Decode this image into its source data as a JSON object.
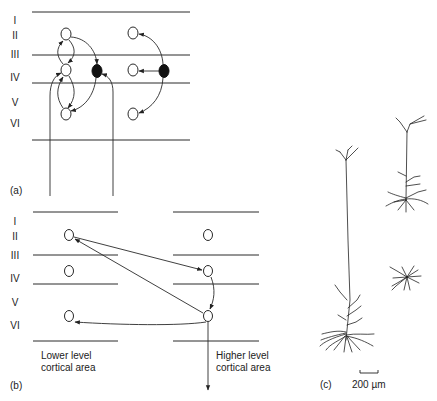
{
  "panel_a": {
    "label": "(a)",
    "layers": [
      "I",
      "II",
      "III",
      "IV",
      "V",
      "VI"
    ]
  },
  "panel_b": {
    "label": "(b)",
    "layers": [
      "I",
      "II",
      "III",
      "IV",
      "V",
      "VI"
    ],
    "lower_area_label_line1": "Lower level",
    "lower_area_label_line2": "cortical area",
    "higher_area_label_line1": "Higher level",
    "higher_area_label_line2": "cortical area"
  },
  "panel_c": {
    "label": "(c)",
    "scale_bar_label": "200 µm"
  },
  "colors": {
    "line": "#2a2a2a",
    "background": "#ffffff",
    "filled_neuron": "#111111"
  }
}
